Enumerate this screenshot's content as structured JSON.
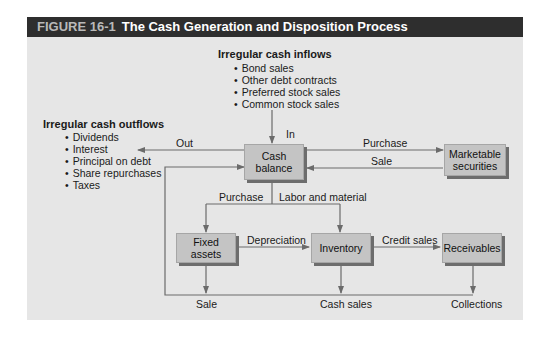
{
  "figure": {
    "number": "FIGURE 16-1",
    "title": "The Cash Generation and Disposition Process"
  },
  "inflows": {
    "heading": "Irregular cash inflows",
    "items": [
      "Bond sales",
      "Other debt contracts",
      "Preferred stock sales",
      "Common stock sales"
    ]
  },
  "outflows": {
    "heading": "Irregular cash outflows",
    "items": [
      "Dividends",
      "Interest",
      "Principal on debt",
      "Share repurchases",
      "Taxes"
    ]
  },
  "nodes": {
    "cash_balance": "Cash balance",
    "marketable_securities": "Marketable securities",
    "fixed_assets": "Fixed assets",
    "inventory": "Inventory",
    "receivables": "Receivables"
  },
  "edge_labels": {
    "in": "In",
    "out": "Out",
    "purchase_securities": "Purchase",
    "sale_securities": "Sale",
    "purchase_fixed": "Purchase",
    "labor_material": "Labor and material",
    "depreciation": "Depreciation",
    "credit_sales": "Credit sales",
    "sale": "Sale",
    "cash_sales": "Cash sales",
    "collections": "Collections"
  },
  "colors": {
    "header_bg": "#2e2e2e",
    "panel_bg": "#e6e6e6",
    "box_fill": "#c4c4c4",
    "box_shadow": "#6d6d6d",
    "line": "#6b6b6b"
  }
}
